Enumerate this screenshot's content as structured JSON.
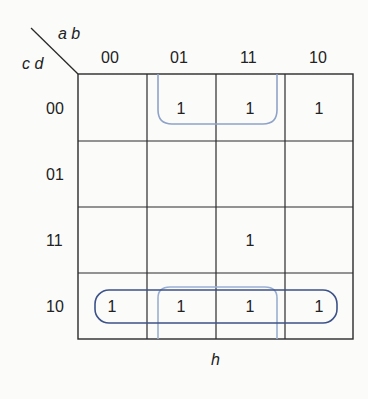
{
  "kmap": {
    "col_var_label": "a b",
    "row_var_label": "c d",
    "col_headers": [
      "00",
      "01",
      "11",
      "10"
    ],
    "row_headers": [
      "00",
      "01",
      "11",
      "10"
    ],
    "cells": [
      [
        "",
        "1",
        "1",
        "1"
      ],
      [
        "",
        "",
        "",
        ""
      ],
      [
        "",
        "",
        "1",
        ""
      ],
      [
        "1",
        "1",
        "1",
        "1"
      ]
    ],
    "caption": "h",
    "groups": [
      {
        "name": "top-loop",
        "cells": "row 00, cols 01-11 (wrap to row 10)",
        "color": "#8fa3c8"
      },
      {
        "name": "bottom-row-loop",
        "cells": "row 10, cols 00-10",
        "color": "#3c5288"
      },
      {
        "name": "bottom-middle-loop",
        "cells": "row 10, cols 01-11 (wrap to row 00)",
        "color": "#9aaed2"
      }
    ],
    "colors": {
      "grid": "#2a2a2a",
      "dark_loop": "#3c5288",
      "light_loop": "#8fa3c8"
    }
  }
}
